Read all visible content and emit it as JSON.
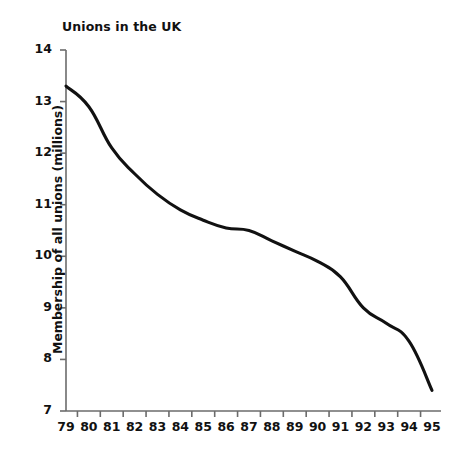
{
  "chart_data": {
    "type": "line",
    "title": "Unions in the UK",
    "xlabel": "",
    "ylabel": "Membership of all unions (millions)",
    "categories": [
      "79",
      "80",
      "81",
      "82",
      "83",
      "84",
      "85",
      "86",
      "87",
      "88",
      "89",
      "90",
      "91",
      "92",
      "93",
      "94",
      "95"
    ],
    "x": [
      79,
      80,
      81,
      82,
      83,
      84,
      85,
      86,
      87,
      88,
      89,
      90,
      91,
      92,
      93,
      94,
      95
    ],
    "values": [
      13.3,
      12.9,
      12.1,
      11.6,
      11.2,
      10.9,
      10.7,
      10.55,
      10.5,
      10.3,
      10.1,
      9.9,
      9.6,
      9.0,
      8.7,
      8.35,
      7.4
    ],
    "series": [
      {
        "name": "Membership of all unions (millions)",
        "values": [
          13.3,
          12.9,
          12.1,
          11.6,
          11.2,
          10.9,
          10.7,
          10.55,
          10.5,
          10.3,
          10.1,
          9.9,
          9.6,
          9.0,
          8.7,
          8.35,
          7.4
        ]
      }
    ],
    "ylim": [
      7,
      14
    ],
    "yticks": [
      7,
      8,
      9,
      10,
      11,
      12,
      13,
      14
    ],
    "ytick_labels": [
      "7",
      "8",
      "9",
      "10",
      "11",
      "12",
      "13",
      "14"
    ],
    "xtick_labels": [
      "79",
      "80",
      "81",
      "82",
      "83",
      "84",
      "85",
      "86",
      "87",
      "88",
      "89",
      "90",
      "91",
      "92",
      "93",
      "94",
      "95"
    ],
    "grid": false,
    "legend": "none",
    "line_color": "#111111",
    "axis_color": "#6b6b6b",
    "background_color": "#ffffff"
  }
}
